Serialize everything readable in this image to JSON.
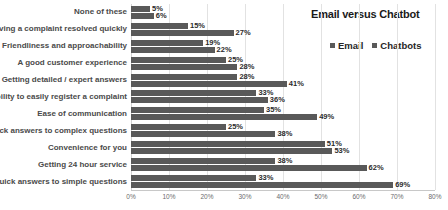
{
  "chart_data": {
    "type": "bar",
    "orientation": "horizontal",
    "title": "Email versus Chatbot",
    "xlabel": "",
    "ylabel": "",
    "xlim": [
      0,
      80
    ],
    "grid": true,
    "legend_position": "top-right",
    "xticks": [
      "0%",
      "10%",
      "20%",
      "30%",
      "40%",
      "50%",
      "60%",
      "70%",
      "80%"
    ],
    "xtick_values": [
      0,
      10,
      20,
      30,
      40,
      50,
      60,
      70,
      80
    ],
    "categories": [
      "None of these",
      "Having a complaint resolved quickly",
      "Friendliness and approachability",
      "A good customer experience",
      "Getting detailed / expert answers",
      "Ability to easily register a complaint",
      "Ease of communication",
      "Quick answers to complex questions",
      "Convenience for you",
      "Getting 24 hour service",
      "Quick answers to simple questions"
    ],
    "series": [
      {
        "name": "Email",
        "color": "#595959",
        "values": [
          5,
          15,
          19,
          25,
          28,
          33,
          35,
          25,
          51,
          38,
          33
        ],
        "labels": [
          "5%",
          "15%",
          "19%",
          "25%",
          "28%",
          "33%",
          "35%",
          "25%",
          "51%",
          "38%",
          "33%"
        ]
      },
      {
        "name": "Chatbots",
        "color": "#595959",
        "values": [
          6,
          27,
          22,
          28,
          41,
          36,
          49,
          38,
          53,
          62,
          69
        ],
        "labels": [
          "6%",
          "27%",
          "22%",
          "28%",
          "41%",
          "36%",
          "49%",
          "38%",
          "53%",
          "62%",
          "69%"
        ]
      }
    ]
  },
  "legend": {
    "items": [
      {
        "label": "Email",
        "swatch": "legend-swatch-email"
      },
      {
        "label": "Chatbots",
        "swatch": "legend-swatch-chatbots"
      }
    ]
  }
}
